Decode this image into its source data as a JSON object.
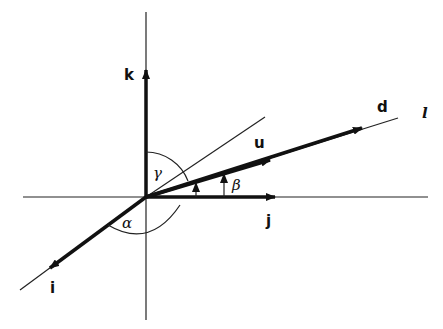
{
  "figure": {
    "type": "vector direction angles diagram",
    "axes": {
      "x_axis_label": "i",
      "y_axis_label": "j",
      "z_axis_label": "k"
    },
    "vectors": {
      "unit_vector": "u",
      "direction_vector": "d",
      "line": "l"
    },
    "angles": {
      "alpha": "α",
      "beta": "β",
      "gamma": "γ"
    }
  }
}
